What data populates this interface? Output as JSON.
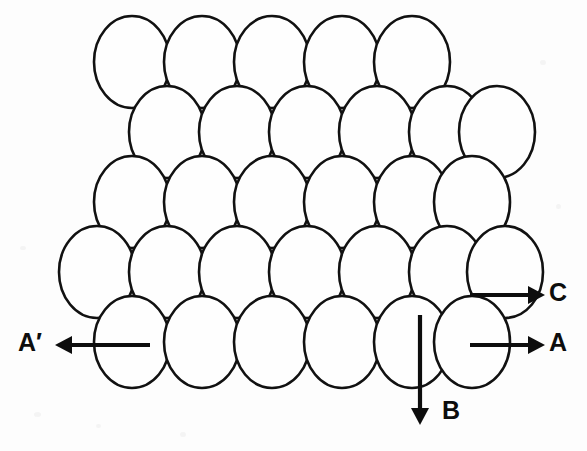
{
  "figure": {
    "title": "Close-packed ellipse lattice with direction vectors",
    "background_color": "#fdfdfd",
    "outline_color": "#111111",
    "fill_color": "#fefefe",
    "arrow_color": "#0d0d0d",
    "width": 587,
    "height": 451
  },
  "lattice": {
    "shape": "ellipse",
    "ellipse_rx": 38,
    "ellipse_ry": 46,
    "row_spacing": 70,
    "column_spacing": 70,
    "stagger_offset": 35,
    "total_count": 30,
    "rows": [
      {
        "index": 1,
        "cy": 62,
        "count": 5,
        "start_cx": 132,
        "cxs": [
          132,
          202,
          272,
          342,
          412
        ]
      },
      {
        "index": 2,
        "cy": 132,
        "count": 6,
        "start_cx": 167,
        "cxs": [
          167,
          237,
          307,
          377,
          447,
          497
        ]
      },
      {
        "index": 3,
        "cy": 202,
        "count": 6,
        "start_cx": 132,
        "cxs": [
          132,
          202,
          272,
          342,
          412,
          472
        ]
      },
      {
        "index": 4,
        "cy": 272,
        "count": 7,
        "start_cx": 97,
        "cxs": [
          97,
          167,
          237,
          307,
          377,
          447,
          505
        ]
      },
      {
        "index": 5,
        "cy": 342,
        "count": 6,
        "start_cx": 132,
        "cxs": [
          132,
          202,
          272,
          342,
          412,
          472
        ]
      }
    ]
  },
  "vectors": [
    {
      "id": "vector-c",
      "label": "C",
      "direction": "right",
      "x1": 470,
      "y1": 295,
      "x2": 528,
      "y2": 295,
      "label_x": 549,
      "label_y": 294
    },
    {
      "id": "vector-a",
      "label": "A",
      "direction": "right",
      "x1": 470,
      "y1": 345,
      "x2": 528,
      "y2": 345,
      "label_x": 549,
      "label_y": 344
    },
    {
      "id": "vector-a-prime",
      "label": "A′",
      "direction": "left",
      "x1": 150,
      "y1": 345,
      "x2": 72,
      "y2": 345,
      "label_x": 42,
      "label_y": 344
    },
    {
      "id": "vector-b",
      "label": "B",
      "direction": "down",
      "x1": 420,
      "y1": 315,
      "x2": 420,
      "y2": 408,
      "label_x": 442,
      "label_y": 412
    }
  ],
  "labels": {
    "a": "A",
    "a_prime": "A′",
    "b": "B",
    "c": "C"
  }
}
